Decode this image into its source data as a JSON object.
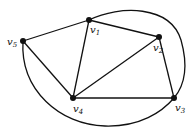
{
  "diagram": {
    "type": "graph",
    "nodes": [
      {
        "id": "v1",
        "label": "v",
        "sub": "1",
        "x": 89,
        "y": 20
      },
      {
        "id": "v2",
        "label": "v",
        "sub": "2",
        "x": 159,
        "y": 37
      },
      {
        "id": "v3",
        "label": "v",
        "sub": "3",
        "x": 174,
        "y": 98
      },
      {
        "id": "v4",
        "label": "v",
        "sub": "4",
        "x": 73,
        "y": 98
      },
      {
        "id": "v5",
        "label": "v",
        "sub": "5",
        "x": 23,
        "y": 41
      }
    ],
    "edges": [
      {
        "from": "v5",
        "to": "v1",
        "shape": "straight"
      },
      {
        "from": "v1",
        "to": "v2",
        "shape": "straight"
      },
      {
        "from": "v2",
        "to": "v3",
        "shape": "straight"
      },
      {
        "from": "v3",
        "to": "v4",
        "shape": "straight"
      },
      {
        "from": "v4",
        "to": "v5",
        "shape": "straight"
      },
      {
        "from": "v1",
        "to": "v4",
        "shape": "straight"
      },
      {
        "from": "v2",
        "to": "v4",
        "shape": "straight"
      },
      {
        "from": "v1",
        "to": "v3",
        "shape": "curved-outer-right"
      },
      {
        "from": "v5",
        "to": "v3",
        "shape": "curved-outer-bottom"
      }
    ]
  }
}
